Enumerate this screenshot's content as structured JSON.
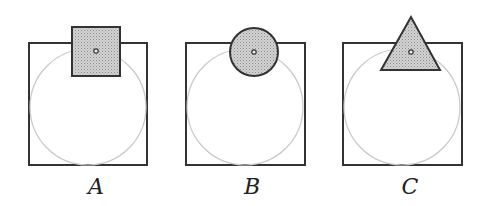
{
  "figures": [
    {
      "label": "A",
      "shape": "square",
      "box": {
        "x": 29,
        "y": 43,
        "w": 118,
        "h": 122
      },
      "shape_geom": {
        "x": 72,
        "y": 27,
        "w": 48,
        "h": 49
      },
      "dot": {
        "x": 96,
        "y": 51
      },
      "label_x": 76,
      "circle": {
        "cx": 88,
        "cy": 107,
        "r": 58
      }
    },
    {
      "label": "B",
      "shape": "circle",
      "box": {
        "x": 186,
        "y": 43,
        "w": 119,
        "h": 122
      },
      "shape_geom": {
        "cx": 254,
        "cy": 52,
        "r": 24
      },
      "dot": {
        "x": 254,
        "y": 52
      },
      "label_x": 232,
      "circle": {
        "cx": 245,
        "cy": 107,
        "r": 58
      }
    },
    {
      "label": "C",
      "shape": "triangle",
      "box": {
        "x": 343,
        "y": 43,
        "w": 119,
        "h": 122
      },
      "shape_geom": {
        "points": "411,17 381,70 440,70"
      },
      "dot": {
        "x": 411,
        "y": 52
      },
      "label_x": 390,
      "circle": {
        "cx": 402,
        "cy": 107,
        "r": 58
      }
    }
  ],
  "colors": {
    "stroke": "#333333",
    "fill": "#bdbdbd",
    "guide_circle": "#c8c8c8"
  }
}
